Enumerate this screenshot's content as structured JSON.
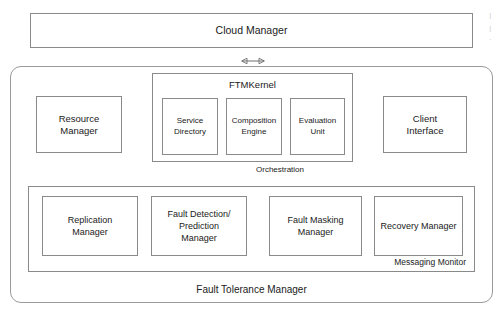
{
  "diagram": {
    "colors": {
      "background": "#ffffff",
      "border": "#8a8a8a",
      "container_border": "#9a9a9a",
      "text": "#1a1a1a",
      "arrow": "#6f6f6f"
    }
  },
  "cloud_manager": {
    "label": "Cloud Manager"
  },
  "ftm_container": {
    "label": "Fault Tolerance Manager"
  },
  "resource_manager": {
    "label": "Resource\nManager"
  },
  "client_interface": {
    "label": "Client\nInterface"
  },
  "ftm_kernel": {
    "title": "FTMKernel",
    "components": [
      {
        "label": "Service\nDirectory"
      },
      {
        "label": "Composition\nEngine"
      },
      {
        "label": "Evaluation\nUnit"
      }
    ]
  },
  "orchestration": {
    "label": "Orchestration"
  },
  "messaging_monitor": {
    "label": "Messaging Monitor",
    "components": [
      {
        "label": "Replication\nManager"
      },
      {
        "label": "Fault Detection/\nPrediction\nManager"
      },
      {
        "label": "Fault Masking\nManager"
      },
      {
        "label": "Recovery Manager"
      }
    ]
  },
  "edge_artifact": {
    "text": "I\nI\nI"
  }
}
